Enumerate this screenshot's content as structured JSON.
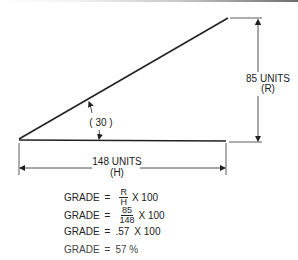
{
  "diagram": {
    "angle_label": "( 30 )",
    "rise_label": "85 UNITS",
    "rise_symbol": "(R)",
    "run_label": "148 UNITS",
    "run_symbol": "(H)"
  },
  "formulas": [
    {
      "lhs": "GRADE",
      "eq": "=",
      "num": "R",
      "den": "H",
      "times": "X 100"
    },
    {
      "lhs": "GRADE",
      "eq": "=",
      "num": "85",
      "den": "148",
      "times": "X 100"
    },
    {
      "lhs": "GRADE",
      "eq": "=",
      "value": ".57",
      "times": "X 100"
    },
    {
      "lhs": "GRADE",
      "eq": "=",
      "result": "57 %"
    }
  ]
}
